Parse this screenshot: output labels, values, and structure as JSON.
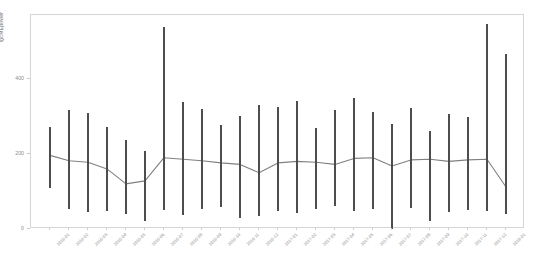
{
  "chart": {
    "type": "error-bar-line",
    "background": "#ffffff",
    "line_color": "#808080",
    "bar_color": "#4d4d4d",
    "frame_color": "#d6d6d6"
  },
  "axes": {
    "y_label": "lgcMEpower",
    "y_ticks": [
      0,
      200,
      400
    ],
    "y_tick_labels": [
      "0",
      "200",
      "400"
    ],
    "ylim": [
      0,
      570
    ],
    "x_label": "",
    "grid": false
  },
  "chart_data": {
    "type": "line",
    "title": "",
    "xlabel": "",
    "ylabel": "lgcMEpower",
    "ylim": [
      0,
      570
    ],
    "grid": false,
    "legend": "none",
    "categories": [
      "2016-01",
      "2016-02",
      "2016-03",
      "2016-04",
      "2016-05",
      "2016-06",
      "2016-07",
      "2016-08",
      "2016-09",
      "2016-10",
      "2016-11",
      "2016-12",
      "2017-01",
      "2017-02",
      "2017-03",
      "2017-04",
      "2017-05",
      "2017-06",
      "2017-07",
      "2017-08",
      "2017-09",
      "2017-10",
      "2017-11",
      "2017-12",
      "2018-01"
    ],
    "series": [
      {
        "name": "mean",
        "values": [
          196,
          182,
          178,
          160,
          120,
          128,
          190,
          186,
          182,
          176,
          172,
          150,
          176,
          180,
          178,
          172,
          188,
          190,
          168,
          184,
          186,
          180,
          184,
          186,
          112
        ]
      },
      {
        "name": "upper",
        "values": [
          272,
          318,
          310,
          272,
          238,
          208,
          538,
          338,
          320,
          276,
          302,
          330,
          326,
          340,
          268,
          318,
          348,
          312,
          280,
          322,
          260,
          306,
          298,
          546,
          466
        ]
      },
      {
        "name": "lower",
        "values": [
          108,
          52,
          44,
          48,
          40,
          22,
          50,
          38,
          52,
          58,
          30,
          34,
          48,
          42,
          52,
          60,
          48,
          52,
          0,
          56,
          20,
          44,
          50,
          48,
          40
        ]
      }
    ]
  }
}
